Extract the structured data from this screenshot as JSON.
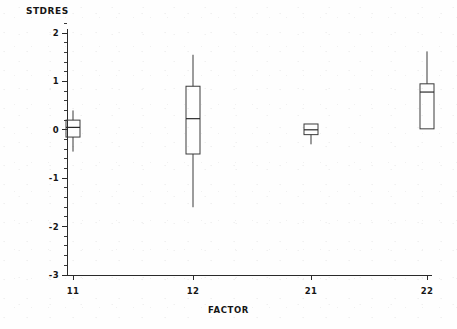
{
  "chart_data": {
    "type": "box",
    "title": "",
    "ylabel": "STDRES",
    "xlabel": "FACTOR",
    "categories": [
      "11",
      "12",
      "21",
      "22"
    ],
    "ylim": [
      -3,
      2
    ],
    "yticks": [
      2,
      1,
      0,
      -1,
      -2,
      -3
    ],
    "ytick_labels": [
      "2",
      "1",
      "0",
      "-1",
      "-2",
      "-3"
    ],
    "minor_ticks_per_interval": 5,
    "grid": false,
    "legend": null,
    "boxes": [
      {
        "category": "11",
        "whisker_low": -0.45,
        "q1": -0.15,
        "median": 0.05,
        "q3": 0.2,
        "whisker_high": 0.4
      },
      {
        "category": "12",
        "whisker_low": -1.6,
        "q1": -0.5,
        "median": 0.23,
        "q3": 0.9,
        "whisker_high": 1.55
      },
      {
        "category": "21",
        "whisker_low": -0.3,
        "q1": -0.1,
        "median": 0.0,
        "q3": 0.12,
        "whisker_high": 0.12
      },
      {
        "category": "22",
        "whisker_low": 0.02,
        "q1": 0.02,
        "median": 0.78,
        "q3": 0.95,
        "whisker_high": 1.62
      }
    ]
  },
  "axes": {
    "y_axis_name": "stdres-axis",
    "x_axis_name": "factor-axis"
  },
  "colors": {
    "ink": "#2a2a2a",
    "background": "#fefefe"
  }
}
